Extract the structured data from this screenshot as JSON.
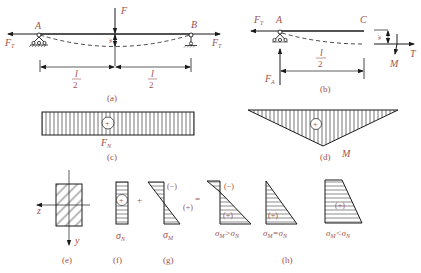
{
  "figure": {
    "panels": {
      "a": {
        "caption": "(a)",
        "labels": {
          "support_left": "A",
          "support_right": "B",
          "force_top": "F",
          "tension_left": "F",
          "tension_left_sub": "T",
          "tension_right": "F",
          "tension_right_sub": "T",
          "deflection": "w",
          "half_span_left_num": "l",
          "half_span_left_den": "2",
          "half_span_right_num": "l",
          "half_span_right_den": "2"
        }
      },
      "b": {
        "caption": "(b)",
        "labels": {
          "support": "A",
          "end": "C",
          "tension_left": "F",
          "tension_left_sub": "T",
          "reaction": "F",
          "reaction_sub": "A",
          "half_span_num": "l",
          "half_span_den": "2",
          "deflection": "w",
          "axial": "T",
          "moment": "M"
        }
      },
      "c": {
        "caption": "(c)",
        "sign": "+",
        "label": "F",
        "label_sub": "N"
      },
      "d": {
        "caption": "(d)",
        "sign": "+",
        "label": "M"
      },
      "e": {
        "caption": "(e)",
        "axis_z": "z",
        "axis_y": "y"
      },
      "f": {
        "caption": "(f)",
        "sign": "+",
        "label": "σ",
        "label_sub": "N"
      },
      "g": {
        "caption": "(g)",
        "sign_top": "(−)",
        "sign_bottom": "(+)",
        "label": "σ",
        "label_sub": "M"
      },
      "h": {
        "caption": "(h)",
        "cases": [
          {
            "sign_top": "(−)",
            "sign_bottom": "(+)",
            "condition": "σ",
            "cond_sub1": "M",
            "cond_op": ">σ",
            "cond_sub2": "N"
          },
          {
            "sign_bottom": "(+)",
            "condition": "σ",
            "cond_sub1": "M",
            "cond_op": "=σ",
            "cond_sub2": "N"
          },
          {
            "sign_bottom": "(+)",
            "condition": "σ",
            "cond_sub1": "M",
            "cond_op": "<σ",
            "cond_sub2": "N"
          }
        ]
      }
    },
    "operators": {
      "plus": "+",
      "equals": "="
    }
  }
}
